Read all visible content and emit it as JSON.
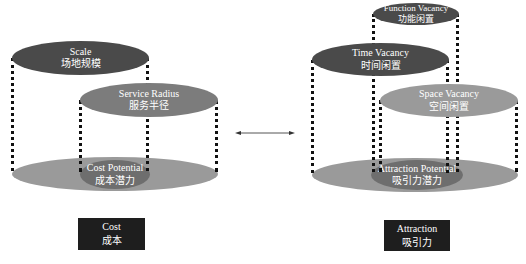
{
  "left": {
    "top_ellipse": {
      "en": "Scale",
      "cn": "场地规模"
    },
    "second_ellipse": {
      "en": "Service Radius",
      "cn": "服务半径"
    },
    "base_ellipse": {
      "en": "Cost Potential",
      "cn": "成本潜力"
    },
    "box": {
      "en": "Cost",
      "cn": "成本"
    }
  },
  "right": {
    "top_ellipse": {
      "en": "Function Vacancy",
      "cn": "功能闲置"
    },
    "second_ellipse": {
      "en": "Time Vacancy",
      "cn": "时间闲置"
    },
    "third_ellipse": {
      "en": "Space Vacancy",
      "cn": "空间闲置"
    },
    "base_ellipse": {
      "en": "Attraction Potential",
      "cn": "吸引力潜力"
    },
    "box": {
      "en": "Attraction",
      "cn": "吸引力"
    }
  },
  "connector": {
    "type": "double-arrow"
  },
  "colors": {
    "dark": "#4a4a4a",
    "mid": "#7c7c7c",
    "light": "#9a9a9a",
    "box": "#1e1e1e"
  }
}
